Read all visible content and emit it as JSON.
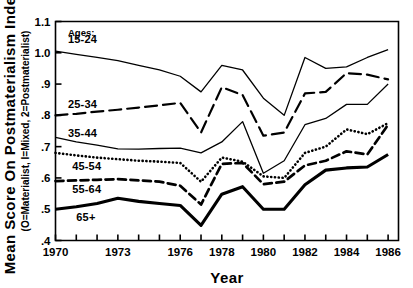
{
  "chart_data": {
    "type": "line",
    "title": "",
    "xlabel": "Year",
    "ylabel": "Mean Score On Postmaterialism Index",
    "ylabel_sub": "(O=Materialist, I=Mixed, 2=Postmaterialist)",
    "x": [
      1970,
      1971,
      1972,
      1973,
      1974,
      1975,
      1976,
      1977,
      1978,
      1979,
      1980,
      1981,
      1982,
      1983,
      1984,
      1985,
      1986
    ],
    "xlim": [
      1970,
      1986.5
    ],
    "ylim": [
      0.4,
      1.1
    ],
    "xticks": [
      1970,
      1971,
      1972,
      1973,
      1974,
      1975,
      1976,
      1977,
      1978,
      1979,
      1980,
      1981,
      1982,
      1983,
      1984,
      1985,
      1986
    ],
    "xticklabels": [
      "1970",
      "",
      "",
      "1973",
      "",
      "",
      "1976",
      "",
      "1978",
      "",
      "1980",
      "",
      "1982",
      "",
      "1984",
      "",
      "1986"
    ],
    "yticks": [
      0.4,
      0.5,
      0.6,
      0.7,
      0.8,
      0.9,
      1.0,
      1.1
    ],
    "yticklabels": [
      ".4",
      ".5",
      ".6",
      ".7",
      ".8",
      ".9",
      "1.0",
      "1.1"
    ],
    "grid": false,
    "legend_position": "inline-left",
    "legend_heading": "Ages:",
    "series": [
      {
        "name": "15-24",
        "style": "solid-thin",
        "label_x": 1970.6,
        "label_y": 1.045,
        "values": [
          1.005,
          0.995,
          0.985,
          0.975,
          0.96,
          0.945,
          0.925,
          0.875,
          0.96,
          0.945,
          0.855,
          0.8,
          0.985,
          0.95,
          0.955,
          0.985,
          1.01
        ]
      },
      {
        "name": "25-34",
        "style": "dashed-long",
        "label_x": 1970.6,
        "label_y": 0.835,
        "values": [
          0.8,
          0.805,
          0.812,
          0.818,
          0.825,
          0.832,
          0.84,
          0.745,
          0.89,
          0.865,
          0.735,
          0.745,
          0.87,
          0.875,
          0.935,
          0.93,
          0.915
        ]
      },
      {
        "name": "35-44",
        "style": "solid-thin",
        "label_x": 1970.6,
        "label_y": 0.745,
        "values": [
          0.73,
          0.715,
          0.705,
          0.693,
          0.692,
          0.694,
          0.695,
          0.68,
          0.715,
          0.78,
          0.615,
          0.655,
          0.77,
          0.79,
          0.835,
          0.835,
          0.9
        ]
      },
      {
        "name": "45-54",
        "style": "dotted",
        "label_x": 1970.8,
        "label_y": 0.638,
        "values": [
          0.68,
          0.672,
          0.665,
          0.66,
          0.655,
          0.652,
          0.648,
          0.588,
          0.665,
          0.652,
          0.605,
          0.6,
          0.68,
          0.7,
          0.755,
          0.74,
          0.775
        ]
      },
      {
        "name": "55-64",
        "style": "dashed",
        "label_x": 1970.8,
        "label_y": 0.565,
        "values": [
          0.59,
          0.592,
          0.594,
          0.596,
          0.592,
          0.588,
          0.575,
          0.515,
          0.645,
          0.648,
          0.58,
          0.588,
          0.64,
          0.655,
          0.685,
          0.675,
          0.77
        ]
      },
      {
        "name": "65+",
        "style": "solid-thick",
        "label_x": 1971.0,
        "label_y": 0.475,
        "values": [
          0.5,
          0.508,
          0.518,
          0.535,
          0.525,
          0.518,
          0.512,
          0.448,
          0.548,
          0.572,
          0.5,
          0.5,
          0.578,
          0.625,
          0.632,
          0.635,
          0.675
        ]
      }
    ]
  }
}
